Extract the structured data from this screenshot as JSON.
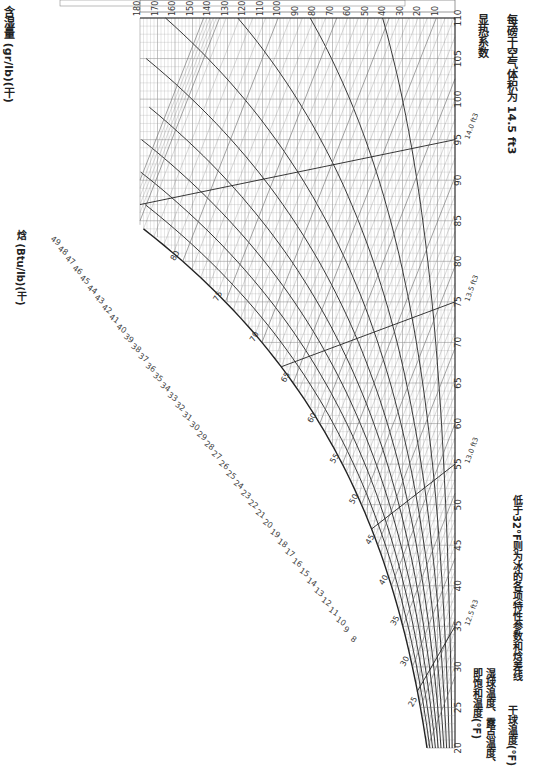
{
  "chart_data": {
    "type": "psychrometric",
    "orientation": "rotated 90° clockwise (dry-bulb axis runs along right edge, bottom to top)",
    "title": "",
    "footnote": "低于32°F则为冰的各项特性参数和焓差线",
    "axes": {
      "dry_bulb": {
        "label": "干球温度(°F)",
        "ticks": [
          20,
          25,
          30,
          35,
          40,
          45,
          50,
          55,
          60,
          65,
          70,
          75,
          80,
          85,
          90,
          95,
          100,
          105,
          110
        ],
        "range": [
          20,
          110
        ]
      },
      "humidity_ratio_gr": {
        "label": "含湿量 (gr/lb)(干)",
        "ticks": [
          10,
          20,
          30,
          40,
          50,
          60,
          70,
          80,
          90,
          100,
          110,
          120,
          130,
          140,
          150,
          160,
          170,
          180
        ],
        "range": [
          0,
          180
        ]
      },
      "humidity_ratio_lb": {
        "label": "含湿量 (lb/lb)(干)",
        "ticks": [
          ".001",
          ".002",
          ".003",
          ".004",
          ".005",
          ".006",
          ".007",
          ".008",
          ".009",
          ".010",
          ".011",
          ".012",
          ".013",
          ".014",
          ".015",
          ".016",
          ".017",
          ".018",
          ".019",
          ".020",
          ".021",
          ".022",
          ".023",
          ".024",
          ".025"
        ]
      },
      "enthalpy": {
        "label": "焓 (Btu/lb)(干)",
        "ticks": [
          8,
          9,
          10,
          11,
          12,
          13,
          14,
          15,
          16,
          17,
          18,
          19,
          20,
          21,
          22,
          23,
          24,
          25,
          26,
          27,
          28,
          29,
          30,
          31,
          32,
          33,
          34,
          35,
          36,
          37,
          38,
          39,
          40,
          41,
          42,
          43,
          44,
          45,
          46,
          47,
          48,
          49
        ]
      },
      "saturation_temp": {
        "label": "湿球温度、露点温度、即饱和温度(°F)",
        "ticks": [
          25,
          30,
          35,
          40,
          45,
          50,
          55,
          60,
          65,
          70,
          75,
          80,
          85,
          90
        ]
      },
      "sensible_heat_factor": {
        "label": "显热系数",
        "ticks": [
          35,
          40,
          45,
          50,
          55,
          60,
          65,
          70,
          75,
          80,
          85,
          90,
          95
        ]
      }
    },
    "relative_humidity_curves": [
      "10%",
      "20%",
      "30%",
      "40%",
      "50%",
      "60%",
      "70%",
      "80%",
      "90%"
    ],
    "rh_label_note": "相对湿度90%",
    "specific_volume_lines": [
      {
        "label": "12.5 ft3",
        "at_db": 35
      },
      {
        "label": "13.0 ft3",
        "at_db": 55
      },
      {
        "label": "13.5 ft3",
        "at_db": 75
      },
      {
        "label": "14.0 ft3",
        "at_db": 95
      }
    ],
    "specific_volume_note": "每磅干空气体积为 14.5 ft3",
    "enthalpy_deviation_lines": [
      "-0.1 Btu",
      "-0.2 Btu",
      "-0.3 Btu"
    ],
    "enthalpy_deviation_note": "每磅干空气的焓差 -0.3 Btu",
    "grid": true
  },
  "labels": {
    "hr_gr": "含湿量 (gr/lb)(干)",
    "hr_lb": "含湿量 (lb/lb)(干)",
    "enthalpy": "焓 (Btu/lb)(干)",
    "shf": "显热系数",
    "sv": "每磅干空气体积为 14.5 ft3",
    "sat": "湿球温度、露点温度、即饱和温度(°F)",
    "db": "干球温度(°F)",
    "footnote": "低于32°F则为冰的各项特性参数和焓差线"
  }
}
